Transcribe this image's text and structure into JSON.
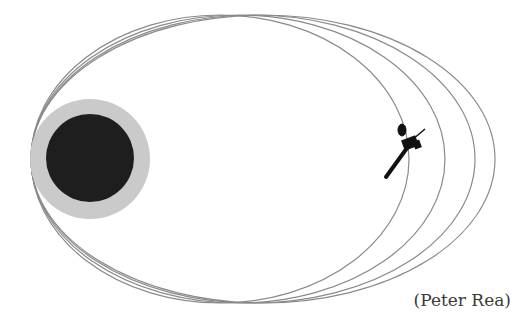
{
  "figure": {
    "credit": "(Peter Rea)",
    "planet": {
      "core_color": "#1f1f1f",
      "halo_color": "#c8c8c8",
      "cx": 90,
      "cy": 159,
      "core_r": 44,
      "halo_r": 60
    },
    "orbits": [
      {
        "cx": 220,
        "cy": 159,
        "rx": 189,
        "ry": 144
      },
      {
        "cx": 238,
        "cy": 159,
        "rx": 207,
        "ry": 144
      },
      {
        "cx": 253,
        "cy": 159,
        "rx": 222,
        "ry": 144
      },
      {
        "cx": 263,
        "cy": 159,
        "rx": 232,
        "ry": 144
      }
    ],
    "orbit_color": "#8a8a8a",
    "spacecraft": {
      "x": 408,
      "y": 150
    }
  }
}
